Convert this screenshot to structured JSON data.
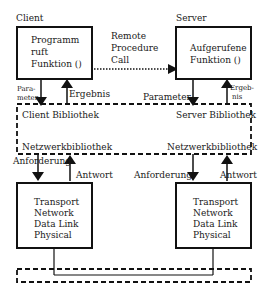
{
  "client": {
    "title": "Client",
    "box_lines": [
      "Programm",
      "ruft",
      "Funktion ()"
    ]
  },
  "server": {
    "title": "Server",
    "box_lines": [
      "Aufgerufene",
      "Funktion ()"
    ]
  },
  "rpc": {
    "lines": [
      "Remote",
      "Procedure",
      "Call"
    ]
  },
  "client_arrows": {
    "param_lines": [
      "Para-",
      "meter"
    ],
    "result": "Ergebnis"
  },
  "server_arrows": {
    "param": "Parameter",
    "result_lines": [
      "Ergeb-",
      "nis"
    ]
  },
  "library": {
    "client_lib": "Client Bibliothek",
    "server_lib": "Server Bibliothek",
    "client_net": "Netzwerkbibliothek",
    "server_net": "Netzwerkbibliothek"
  },
  "network_arrows": {
    "left_request": "Anforderung",
    "left_response": "Antwort",
    "right_request": "Anforderung",
    "right_response": "Antwort"
  },
  "stacks": {
    "left": [
      "Transport",
      "Network",
      "Data Link",
      "Physical"
    ],
    "right": [
      "Transport",
      "Network",
      "Data Link",
      "Physical"
    ]
  }
}
